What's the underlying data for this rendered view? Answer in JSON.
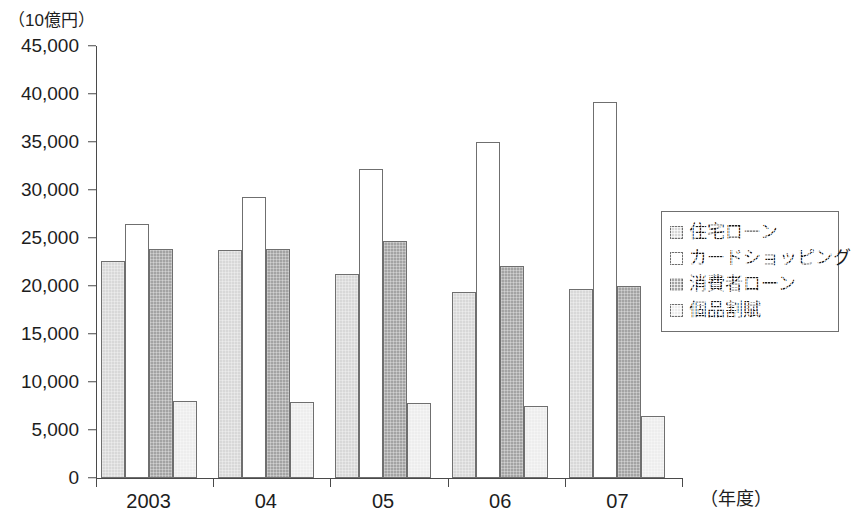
{
  "chart_data": {
    "type": "bar",
    "title": "",
    "subtitle": "",
    "unit_label": "（10億円）",
    "xlabel": "（年度）",
    "ylabel": "",
    "categories": [
      "2003",
      "04",
      "05",
      "06",
      "07"
    ],
    "series": [
      {
        "name": "住宅ローン",
        "color": "#d8d8d8",
        "values": [
          22600,
          23800,
          21300,
          19400,
          19700
        ]
      },
      {
        "name": "カードショッピング",
        "color": "#ffffff",
        "values": [
          26500,
          29300,
          32200,
          35000,
          39200
        ]
      },
      {
        "name": "消費者ローン",
        "color": "#a3a3a3",
        "values": [
          23900,
          23900,
          24700,
          22100,
          20000
        ]
      },
      {
        "name": "個品割賦",
        "color": "#ededed",
        "values": [
          8000,
          7900,
          7800,
          7500,
          6500
        ]
      }
    ],
    "ylim": [
      0,
      45000
    ],
    "ytick_values": [
      0,
      5000,
      10000,
      15000,
      20000,
      25000,
      30000,
      35000,
      40000,
      45000
    ],
    "ytick_labels": [
      "0",
      "5,000",
      "10,000",
      "15,000",
      "20,000",
      "25,000",
      "30,000",
      "35,000",
      "40,000",
      "45,000"
    ],
    "grid": false,
    "legend_position": "right"
  },
  "legend": {
    "items": [
      {
        "label": "住宅ローン"
      },
      {
        "label": "カードショッピング"
      },
      {
        "label": "消費者ローン"
      },
      {
        "label": "個品割賦"
      }
    ]
  }
}
